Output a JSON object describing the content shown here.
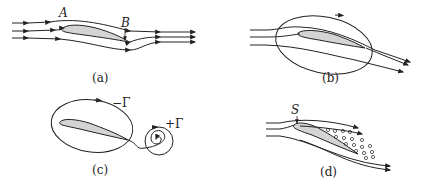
{
  "panels": [
    {
      "id": "a",
      "caption": "(a)",
      "labels": [
        "A",
        "B"
      ]
    },
    {
      "id": "b",
      "caption": "(b)",
      "labels": []
    },
    {
      "id": "c",
      "caption": "(c)",
      "labels": [
        "−Γ",
        "+Γ"
      ]
    },
    {
      "id": "d",
      "caption": "(d)",
      "labels": [
        "S"
      ]
    }
  ],
  "colors": {
    "stroke": "#222222",
    "airfoil_fill": "#d4d4d4",
    "background": "#ffffff"
  }
}
